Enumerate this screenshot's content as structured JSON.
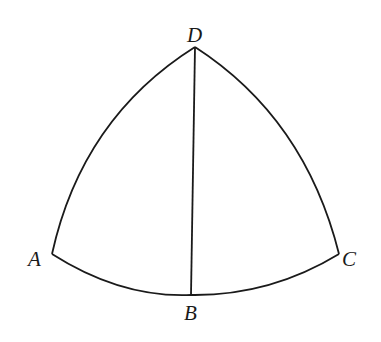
{
  "diagram": {
    "type": "spherical-triangle",
    "stroke_color": "#1a1a1a",
    "background": "#ffffff",
    "vertices": {
      "D": {
        "label": "D",
        "x": 195,
        "y": 47
      },
      "A": {
        "label": "A",
        "x": 52,
        "y": 254
      },
      "B": {
        "label": "B",
        "x": 191,
        "y": 295
      },
      "C": {
        "label": "C",
        "x": 339,
        "y": 254
      }
    },
    "edges": [
      {
        "from": "D",
        "to": "A",
        "kind": "arc"
      },
      {
        "from": "D",
        "to": "C",
        "kind": "arc"
      },
      {
        "from": "A",
        "to": "C",
        "kind": "arc",
        "through": "B"
      },
      {
        "from": "D",
        "to": "B",
        "kind": "line"
      }
    ],
    "labels": {
      "D": "D",
      "A": "A",
      "B": "B",
      "C": "C"
    }
  }
}
